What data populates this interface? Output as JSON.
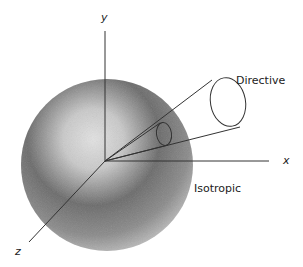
{
  "diagram": {
    "axes": {
      "x": "x",
      "y": "y",
      "z": "z"
    },
    "labels": {
      "directive": "Directive",
      "isotropic": "Isotropic"
    },
    "colors": {
      "line": "#333333",
      "sphere_light": "#d8d8d8",
      "sphere_dark": "#555555",
      "background": "#ffffff"
    }
  }
}
